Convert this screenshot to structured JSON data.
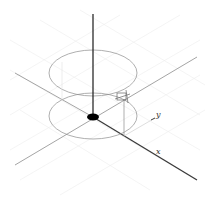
{
  "diagram": {
    "type": "3d-axes-cylinder",
    "colors": {
      "grid": "#ececec",
      "axis_light": "#9a9a9a",
      "axis_dark": "#3a3a3a",
      "ellipse": "#8c8c8c",
      "origin_dot": "#000000"
    },
    "labels": {
      "x_axis": "x",
      "y_axis": "y"
    },
    "origin": [
      93,
      117
    ],
    "cylinder": {
      "top_ellipse": {
        "cx": 93,
        "cy": 73,
        "rx": 44,
        "ry": 23
      },
      "bottom_ellipse": {
        "cx": 93,
        "cy": 116,
        "rx": 44,
        "ry": 23
      }
    },
    "marker_point": [
      123,
      97
    ],
    "corner_mark": "ˇ"
  }
}
